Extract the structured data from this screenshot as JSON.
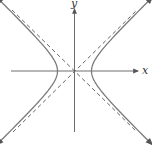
{
  "diagram": {
    "type": "hyperbola",
    "equation_form": "x^2/a^2 - y^2/b^2 = 1",
    "orientation": "horizontal transverse axis",
    "axes": {
      "x_label": "x",
      "y_label": "y"
    },
    "asymptotes": {
      "style": "dashed",
      "count": 2
    },
    "branches": 2,
    "colors": {
      "curve": "#7a7a7a",
      "axis": "#6e6e6e",
      "asymptote": "#555555"
    }
  }
}
